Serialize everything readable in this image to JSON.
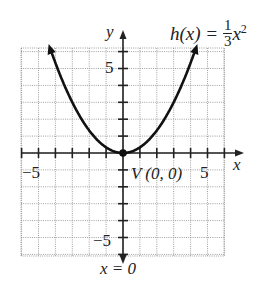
{
  "chart_data": {
    "type": "line",
    "function": "h(x) = (1/3) x^2",
    "xlabel": "x",
    "ylabel": "y",
    "xlim": [
      -6,
      6
    ],
    "ylim": [
      -6,
      6
    ],
    "grid": true,
    "x_tick_labels": [
      "-5",
      "5"
    ],
    "y_tick_labels": [
      "5",
      "-5"
    ],
    "series": [
      {
        "name": "h(x)",
        "x": [
          -4.2,
          -3,
          -2,
          -1,
          0,
          1,
          2,
          3,
          4.2
        ],
        "y": [
          5.88,
          3,
          1.33,
          0.33,
          0,
          0.33,
          1.33,
          3,
          5.88
        ]
      }
    ],
    "annotations": [
      {
        "text": "V (0, 0)",
        "x": 0,
        "y": 0,
        "type": "vertex"
      },
      {
        "text": "x = 0",
        "type": "axis of symmetry"
      }
    ]
  },
  "labels": {
    "y_axis": "y",
    "x_axis": "x",
    "fn_name": "h(x) = ",
    "fn_num": "1",
    "fn_den": "3",
    "fn_var": "x",
    "fn_exp": "2",
    "tick_y5": "5",
    "tick_yneg5": "−5",
    "tick_x5": "5",
    "tick_xneg5": "−5",
    "vertex": "V (0, 0)",
    "symmetry": "x = 0"
  }
}
